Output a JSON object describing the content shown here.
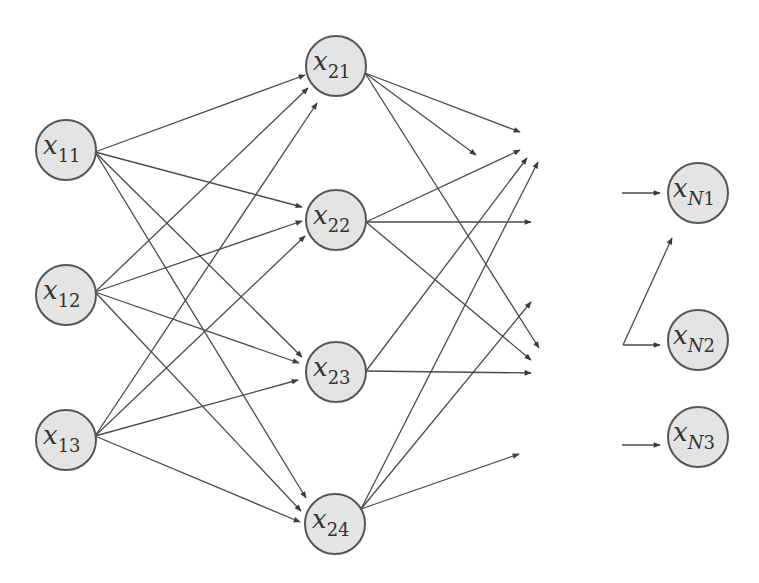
{
  "diagram": {
    "title": "",
    "colors": {
      "node_fill": "#e4e4e4",
      "node_stroke": "#555555",
      "edge": "#4a4a4a",
      "text": "#333333",
      "background": "#ffffff"
    },
    "node_radius": 30,
    "nodes": [
      {
        "id": "x11",
        "base": "x",
        "sub": "11",
        "cx": 66,
        "cy": 150
      },
      {
        "id": "x12",
        "base": "x",
        "sub": "12",
        "cx": 66,
        "cy": 295
      },
      {
        "id": "x13",
        "base": "x",
        "sub": "13",
        "cx": 66,
        "cy": 440
      },
      {
        "id": "x21",
        "base": "x",
        "sub": "21",
        "cx": 336,
        "cy": 66
      },
      {
        "id": "x22",
        "base": "x",
        "sub": "22",
        "cx": 336,
        "cy": 220
      },
      {
        "id": "x23",
        "base": "x",
        "sub": "23",
        "cx": 336,
        "cy": 372
      },
      {
        "id": "x24",
        "base": "x",
        "sub": "24",
        "cx": 335,
        "cy": 524
      },
      {
        "id": "xN1",
        "base": "x",
        "sub": "N1",
        "cx": 698,
        "cy": 193
      },
      {
        "id": "xN2",
        "base": "x",
        "sub": "N2",
        "cx": 698,
        "cy": 340
      },
      {
        "id": "xN3",
        "base": "x",
        "sub": "N3",
        "cx": 698,
        "cy": 437
      }
    ],
    "edges": [
      {
        "from": "x11",
        "x1": 95,
        "y1": 152,
        "x2": 305,
        "y2": 75
      },
      {
        "from": "x11",
        "x1": 95,
        "y1": 152,
        "x2": 302,
        "y2": 207
      },
      {
        "from": "x11",
        "x1": 95,
        "y1": 152,
        "x2": 302,
        "y2": 357
      },
      {
        "from": "x11",
        "x1": 95,
        "y1": 152,
        "x2": 306,
        "y2": 498
      },
      {
        "from": "x12",
        "x1": 95,
        "y1": 292,
        "x2": 308,
        "y2": 88
      },
      {
        "from": "x12",
        "x1": 95,
        "y1": 292,
        "x2": 302,
        "y2": 221
      },
      {
        "from": "x12",
        "x1": 95,
        "y1": 292,
        "x2": 299,
        "y2": 363
      },
      {
        "from": "x12",
        "x1": 95,
        "y1": 292,
        "x2": 301,
        "y2": 511
      },
      {
        "from": "x13",
        "x1": 95,
        "y1": 436,
        "x2": 317,
        "y2": 103
      },
      {
        "from": "x13",
        "x1": 95,
        "y1": 436,
        "x2": 305,
        "y2": 236
      },
      {
        "from": "x13",
        "x1": 95,
        "y1": 436,
        "x2": 298,
        "y2": 380
      },
      {
        "from": "x13",
        "x1": 95,
        "y1": 436,
        "x2": 300,
        "y2": 522
      },
      {
        "from": "x21",
        "x1": 365,
        "y1": 73,
        "x2": 520,
        "y2": 132
      },
      {
        "from": "x21",
        "x1": 365,
        "y1": 73,
        "x2": 476,
        "y2": 155
      },
      {
        "from": "x21",
        "x1": 365,
        "y1": 73,
        "x2": 539,
        "y2": 348
      },
      {
        "from": "x22",
        "x1": 366,
        "y1": 222,
        "x2": 520,
        "y2": 150
      },
      {
        "from": "x22",
        "x1": 366,
        "y1": 222,
        "x2": 531,
        "y2": 222
      },
      {
        "from": "x22",
        "x1": 366,
        "y1": 222,
        "x2": 531,
        "y2": 360
      },
      {
        "from": "x23",
        "x1": 366,
        "y1": 371,
        "x2": 527,
        "y2": 158
      },
      {
        "from": "x23",
        "x1": 366,
        "y1": 371,
        "x2": 531,
        "y2": 373
      },
      {
        "from": "x24",
        "x1": 361,
        "y1": 509,
        "x2": 538,
        "y2": 162
      },
      {
        "from": "x24",
        "x1": 361,
        "y1": 509,
        "x2": 531,
        "y2": 302
      },
      {
        "from": "x24",
        "x1": 361,
        "y1": 509,
        "x2": 519,
        "y2": 454
      },
      {
        "from": "in-N1",
        "x1": 622,
        "y1": 193,
        "x2": 660,
        "y2": 193
      },
      {
        "from": "in-N2",
        "x1": 623,
        "y1": 345,
        "x2": 672,
        "y2": 238
      },
      {
        "from": "in-N2",
        "x1": 623,
        "y1": 345,
        "x2": 660,
        "y2": 345
      },
      {
        "from": "in-N3",
        "x1": 622,
        "y1": 445,
        "x2": 660,
        "y2": 445
      }
    ]
  }
}
